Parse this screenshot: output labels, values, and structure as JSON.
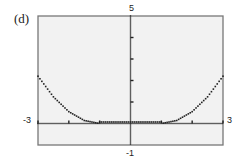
{
  "panel": {
    "label": "(d)"
  },
  "window": {
    "xmin": "-3",
    "xmax": "3",
    "ymin": "-1",
    "ymax": "5"
  },
  "colors": {
    "frame": "#777777",
    "background": "#f2f2f2",
    "dots": "#222222"
  },
  "chart_data": {
    "type": "scatter",
    "title": "(d)",
    "xlabel": "",
    "ylabel": "",
    "xlim": [
      -3,
      3
    ],
    "ylim": [
      -1,
      5
    ],
    "x_tick_labels": [
      "-3",
      "3"
    ],
    "y_tick_labels": [
      "-1",
      "5"
    ],
    "y_ticks": [
      1,
      2,
      3,
      4
    ],
    "grid": false,
    "style": "dotted graphing-calculator plot",
    "series": [
      {
        "name": "curve",
        "x": [
          -3,
          -2.5,
          -2,
          -1.5,
          -1,
          -0.5,
          0,
          0.5,
          1,
          1.5,
          2,
          2.5,
          3
        ],
        "y": [
          2.2,
          1.24,
          0.55,
          0.14,
          0,
          0,
          0,
          0,
          0,
          0.14,
          0.55,
          1.24,
          2.2
        ]
      }
    ]
  }
}
